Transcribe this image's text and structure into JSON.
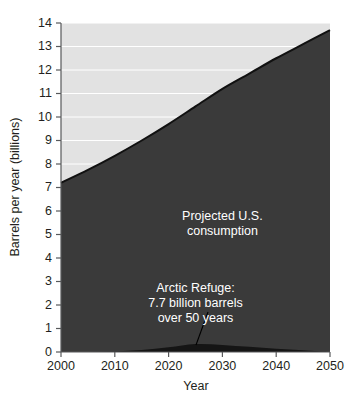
{
  "chart_data": {
    "type": "area",
    "title": "",
    "xlabel": "Year",
    "ylabel": "Barrels per year (billions)",
    "xlim": [
      2000,
      2050
    ],
    "ylim": [
      0,
      14
    ],
    "grid": true,
    "legend_position": "none",
    "xticks": [
      2000,
      2010,
      2020,
      2030,
      2040,
      2050
    ],
    "xtick_labels": [
      "2000",
      "2010",
      "2020",
      "2030",
      "2040",
      "2050"
    ],
    "yticks": [
      0,
      1,
      2,
      3,
      4,
      5,
      6,
      7,
      8,
      9,
      10,
      11,
      12,
      13,
      14
    ],
    "ytick_labels": [
      "0",
      "1",
      "2",
      "3",
      "4",
      "5",
      "6",
      "7",
      "8",
      "9",
      "10",
      "11",
      "12",
      "13",
      "14"
    ],
    "x": [
      2000,
      2005,
      2010,
      2015,
      2020,
      2025,
      2030,
      2035,
      2040,
      2045,
      2050
    ],
    "series": [
      {
        "name": "Projected U.S. consumption",
        "values": [
          7.2,
          7.75,
          8.35,
          9.0,
          9.7,
          10.45,
          11.2,
          11.85,
          12.5,
          13.1,
          13.7
        ],
        "color": "#3a3a3a",
        "line_color": "#111111"
      },
      {
        "name": "Arctic Refuge production",
        "values": [
          0.0,
          0.0,
          0.02,
          0.08,
          0.2,
          0.34,
          0.3,
          0.22,
          0.14,
          0.07,
          0.0
        ],
        "color": "#151515",
        "line_color": "#000000"
      }
    ],
    "annotations": [
      {
        "id": "consumption-annotation",
        "lines": [
          "Projected U.S.",
          "consumption"
        ],
        "x": 2030,
        "y": 5.6,
        "color": "#ffffff"
      },
      {
        "id": "arctic-annotation",
        "lines": [
          "Arctic Refuge:",
          "7.7 billion barrels",
          "over 50 years"
        ],
        "x": 2025,
        "y": 2.55,
        "color": "#ffffff"
      }
    ],
    "colors": {
      "plot_background": "#e2e2e2",
      "consumption_fill": "#3a3a3a",
      "arctic_fill": "#151515",
      "gridline": "#ffffff",
      "axis": "#58595b",
      "text": "#231f20",
      "annotation_text": "#ffffff",
      "page_background": "#ffffff"
    }
  }
}
